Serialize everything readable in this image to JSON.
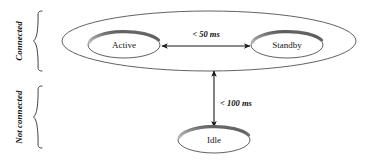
{
  "diagram": {
    "groups": [
      {
        "id": "connected",
        "label": "Connected"
      },
      {
        "id": "not-connected",
        "label": "Not connected"
      }
    ],
    "states": [
      {
        "id": "active",
        "label": "Active",
        "cx": 124,
        "cy": 45,
        "rx": 36,
        "ry": 13
      },
      {
        "id": "standby",
        "label": "Standby",
        "cx": 287,
        "cy": 45,
        "rx": 36,
        "ry": 13
      },
      {
        "id": "idle",
        "label": "Idle",
        "cx": 214,
        "cy": 140,
        "rx": 36,
        "ry": 13
      }
    ],
    "container": {
      "id": "connected-container",
      "cx": 209,
      "cy": 41,
      "rx": 147,
      "ry": 30
    },
    "transitions": [
      {
        "id": "active-standby",
        "from": "active",
        "to": "standby",
        "label": "< 50 ms",
        "orientation": "horizontal",
        "label_x": 206,
        "label_y": 35
      },
      {
        "id": "connected-idle",
        "from": "connected-group",
        "to": "idle",
        "label": "< 100 ms",
        "orientation": "vertical",
        "label_x": 236,
        "label_y": 104
      }
    ],
    "colors": {
      "stroke": "#3a3a3a",
      "arrow": "#1a1a1a",
      "rim_dark": "#6e6e6e",
      "rim_light": "#c9c9c9",
      "text": "#161616",
      "background": "#ffffff"
    }
  }
}
